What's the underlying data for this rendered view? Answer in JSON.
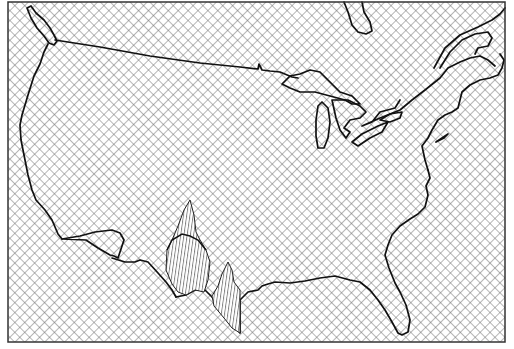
{
  "map": {
    "type": "outline-map",
    "region": "contiguous-united-states",
    "background_pattern": "crosshatch",
    "highlight_pattern": "vertical-hatch",
    "colors": {
      "background": "#ffffff",
      "line": "#000000",
      "hatch": "#6e6e6e",
      "highlight_fill": "#ffffff"
    },
    "frame": {
      "x": 8,
      "y": 2,
      "width": 497,
      "height": 340
    },
    "highlighted_features": [
      {
        "name": "texas-surface-peak-west",
        "shape": "spike"
      },
      {
        "name": "texas-surface-peak-east",
        "shape": "spike"
      }
    ]
  }
}
